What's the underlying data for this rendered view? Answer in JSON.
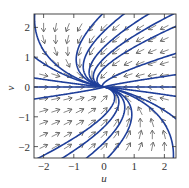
{
  "chart_data": {
    "type": "phase_portrait",
    "title": "",
    "xlabel": "u",
    "ylabel": "v",
    "xlim": [
      -2.35,
      2.35
    ],
    "ylim": [
      -2.4,
      2.4
    ],
    "xticks": [
      -2,
      -1,
      0,
      1,
      2
    ],
    "yticks": [
      -2,
      -1,
      0,
      1,
      2
    ],
    "xtick_labels": [
      "−2",
      "−1",
      "0",
      "1",
      "2"
    ],
    "ytick_labels": [
      "−2",
      "−1",
      "0",
      "1",
      "2"
    ],
    "grid": false,
    "system": {
      "du_dt": "-u - v",
      "dv_dt": "-v"
    },
    "equilibrium": [
      0,
      0
    ],
    "arrow_grid_spacing": 0.4,
    "trajectory_seeds": [
      {
        "c1": -2.3,
        "c2": 2.3
      },
      {
        "c1": -0.1,
        "c2": 2.4
      },
      {
        "c1": 0.6,
        "c2": 2.4
      },
      {
        "c1": 1.4,
        "c2": 2.4
      },
      {
        "c1": 2.2,
        "c2": 2.4
      },
      {
        "c1": -2.3,
        "c2": 1.0
      },
      {
        "c1": -2.3,
        "c2": 0.3
      },
      {
        "c1": -2.3,
        "c2": -0.4
      },
      {
        "c1": 2.3,
        "c2": 2.0
      },
      {
        "c1": 2.3,
        "c2": 1.1
      },
      {
        "c1": 2.3,
        "c2": 0.4
      },
      {
        "c1": 2.3,
        "c2": -0.3
      },
      {
        "c1": 2.3,
        "c2": -1.0
      },
      {
        "c1": 0.1,
        "c2": -2.4
      },
      {
        "c1": -0.6,
        "c2": -2.4
      },
      {
        "c1": -1.4,
        "c2": -2.4
      },
      {
        "c1": -2.2,
        "c2": -2.4
      },
      {
        "c1": 2.3,
        "c2": -2.3
      }
    ],
    "colors": {
      "trajectory": "#1f3f9a",
      "arrow": "#555555",
      "frame": "#333333"
    }
  }
}
